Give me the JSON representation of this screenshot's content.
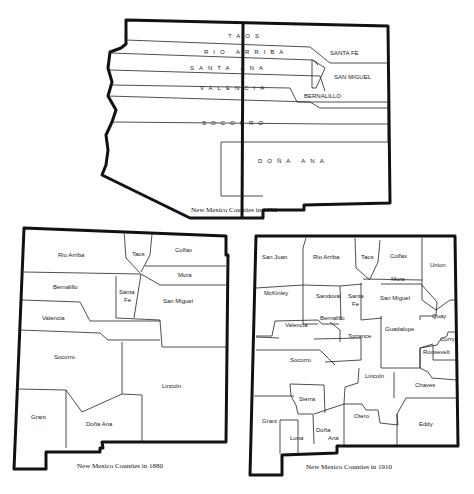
{
  "maps": [
    {
      "year": "1852",
      "caption": "New Mexico Counties in 1852",
      "counties": [
        "TAOS",
        "RIO ARRIBA",
        "SANTA ANA",
        "VALENCIA",
        "SOCORRO",
        "DOÑA ANA",
        "SANTA FE",
        "SAN MIGUEL",
        "BERNALILLO"
      ]
    },
    {
      "year": "1880",
      "caption": "New Mexico Counties in 1880",
      "counties": [
        "Rio Arriba",
        "Taos",
        "Colfax",
        "Mora",
        "Bernalillo",
        "Santa",
        "Fe",
        "San Miguel",
        "Valencia",
        "Socorro",
        "Lincoln",
        "Grant",
        "Doña Ana"
      ]
    },
    {
      "year": "1910",
      "caption": "New Mexico Counties in 1910",
      "counties": [
        "San Juan",
        "Rio Arriba",
        "Taos",
        "Colfax",
        "Union",
        "Mora",
        "McKinley",
        "Sandoval",
        "Santa",
        "Fe",
        "San Miguel",
        "Bernalillo",
        "Valencia",
        "Torrance",
        "Guadalupe",
        "Quay",
        "Curry",
        "Roosevelt",
        "Socorro",
        "Lincoln",
        "Chaves",
        "Sierra",
        "Grant",
        "Otero",
        "Luna",
        "Doña",
        "Ana",
        "Eddy"
      ]
    }
  ]
}
